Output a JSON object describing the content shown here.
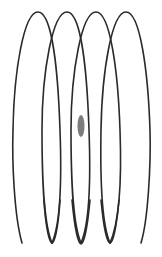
{
  "figure": {
    "description": "Side view of a helical coil drawn as four overlapping loops with a small gray shaded blob near the center",
    "stroke_color": "#2a2a2a",
    "blob_color": "#6e6e6e",
    "background": "#ffffff",
    "loop_count": 4,
    "top_apex_x": [
      38,
      67,
      96,
      126
    ],
    "bottom_apex_x": [
      22,
      52,
      81,
      110,
      141
    ],
    "top_y": 12,
    "bottom_y": 243,
    "blob": {
      "cx": 81,
      "cy": 126,
      "rx": 3.5,
      "ry": 11
    }
  }
}
